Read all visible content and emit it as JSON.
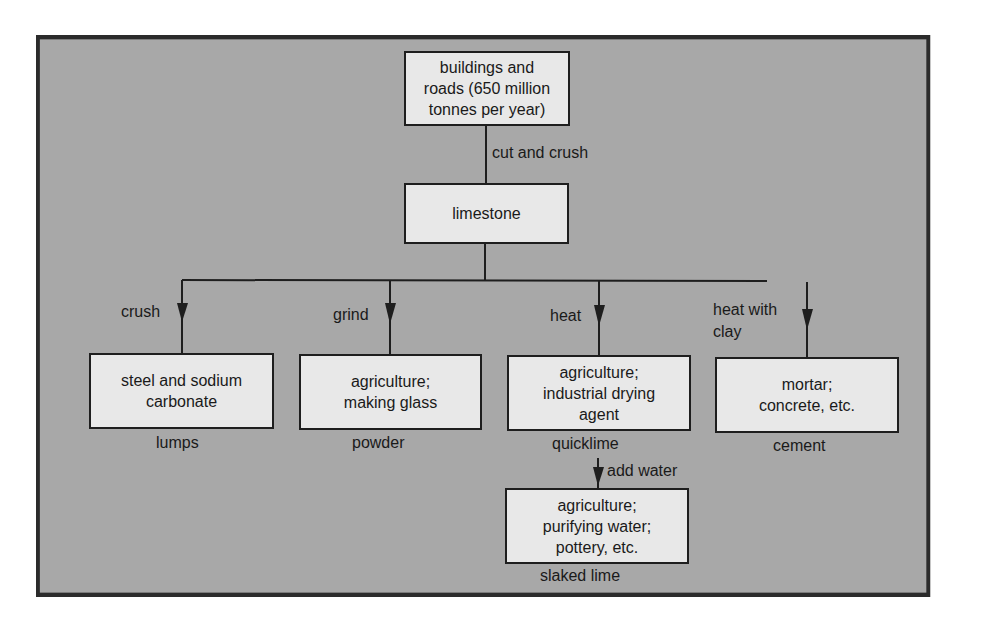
{
  "diagram": {
    "colors": {
      "panel_background": "#a8a8a8",
      "box_fill": "#e8e8e8",
      "stroke": "#1e1e1e"
    },
    "nodes": {
      "buildings": "buildings and\nroads (650 million\ntonnes per year)",
      "limestone": "limestone",
      "steel": "steel and sodium\ncarbonate",
      "agri_glass": "agriculture;\nmaking glass",
      "agri_drying": "agriculture;\nindustrial drying\nagent",
      "mortar": "mortar;\nconcrete, etc.",
      "agri_water": "agriculture;\npurifying water;\npottery, etc."
    },
    "edge_labels": {
      "cut_and_crush": "cut and crush",
      "crush": "crush",
      "grind": "grind",
      "heat": "heat",
      "heat_with_clay": "heat with\nclay",
      "add_water": "add water"
    },
    "product_labels": {
      "lumps": "lumps",
      "powder": "powder",
      "quicklime": "quicklime",
      "cement": "cement",
      "slaked_lime": "slaked lime"
    },
    "edges": [
      {
        "from": "buildings",
        "to": "limestone",
        "label": "cut and crush"
      },
      {
        "from": "limestone",
        "to": "steel",
        "label": "crush",
        "product": "lumps"
      },
      {
        "from": "limestone",
        "to": "agri_glass",
        "label": "grind",
        "product": "powder"
      },
      {
        "from": "limestone",
        "to": "agri_drying",
        "label": "heat",
        "product": "quicklime"
      },
      {
        "from": "limestone",
        "to": "mortar",
        "label": "heat with clay",
        "product": "cement"
      },
      {
        "from": "agri_drying",
        "to": "agri_water",
        "label": "add water",
        "product": "slaked lime"
      }
    ]
  }
}
